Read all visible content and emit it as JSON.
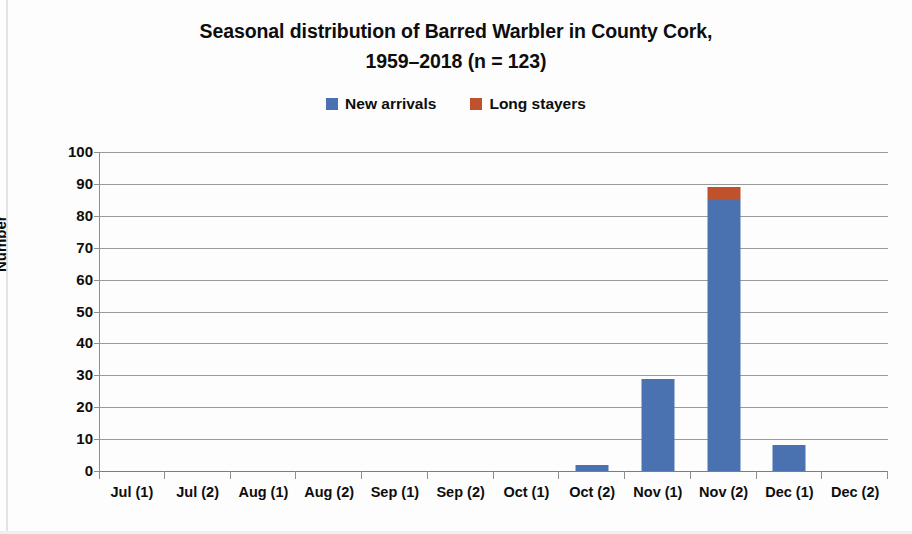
{
  "chart_data": {
    "type": "bar",
    "title": "Seasonal distribution of Barred Warbler in County Cork,",
    "title_line2": "1959–2018 (n = 123)",
    "subtitle": "",
    "xlabel": "",
    "ylabel": "Number",
    "ylim": [
      0,
      100
    ],
    "ytick_step": 10,
    "grid": true,
    "stacked": true,
    "legend_position": "top-center",
    "categories": [
      "Jul (1)",
      "Jul (2)",
      "Aug (1)",
      "Aug (2)",
      "Sep (1)",
      "Sep (2)",
      "Oct (1)",
      "Oct (2)",
      "Nov (1)",
      "Nov (2)",
      "Dec (1)",
      "Dec (2)"
    ],
    "ytick_labels": [
      "100",
      "90",
      "80",
      "70",
      "60",
      "50",
      "40",
      "30",
      "20",
      "10",
      "0"
    ],
    "ytick_values": [
      100,
      90,
      80,
      70,
      60,
      50,
      40,
      30,
      20,
      10,
      0
    ],
    "series": [
      {
        "name": "New arrivals",
        "color": "#4a72b0",
        "values": [
          0,
          0,
          0,
          0,
          0,
          0,
          0,
          2,
          29,
          85,
          8,
          0
        ]
      },
      {
        "name": "Long stayers",
        "color": "#c0512d",
        "values": [
          0,
          0,
          0,
          0,
          0,
          0,
          0,
          0,
          0,
          4,
          0,
          0
        ]
      }
    ]
  }
}
